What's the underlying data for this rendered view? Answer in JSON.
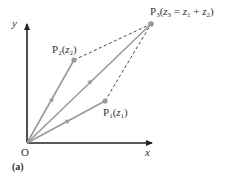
{
  "figure": {
    "panel_label": "(a)",
    "origin_label": "O",
    "x_axis_label": "x",
    "y_axis_label": "y"
  },
  "points": {
    "p1": {
      "name": "P",
      "sub": "1",
      "arg_open": "(",
      "z": "z",
      "zsub": "1",
      "arg_close": ")"
    },
    "p2": {
      "name": "P",
      "sub": "2",
      "arg_open": "(",
      "z": "z",
      "zsub": "2",
      "arg_close": ")"
    },
    "p3": {
      "name": "P",
      "sub": "3",
      "arg_open": "(",
      "z": "z",
      "zsub": "3",
      "eq": " = ",
      "z1": "z",
      "z1sub": "1",
      "plus": " + ",
      "z2": "z",
      "z2sub": "2",
      "arg_close": ")"
    }
  },
  "colors": {
    "axis": "#222222",
    "vector": "#9a9a9a",
    "dashed": "#444444",
    "point": "#9a9a9a"
  },
  "geometry": {
    "origin": [
      27,
      143
    ],
    "P1": [
      105,
      101
    ],
    "P2": [
      74,
      60
    ],
    "P3": [
      151,
      24
    ]
  }
}
